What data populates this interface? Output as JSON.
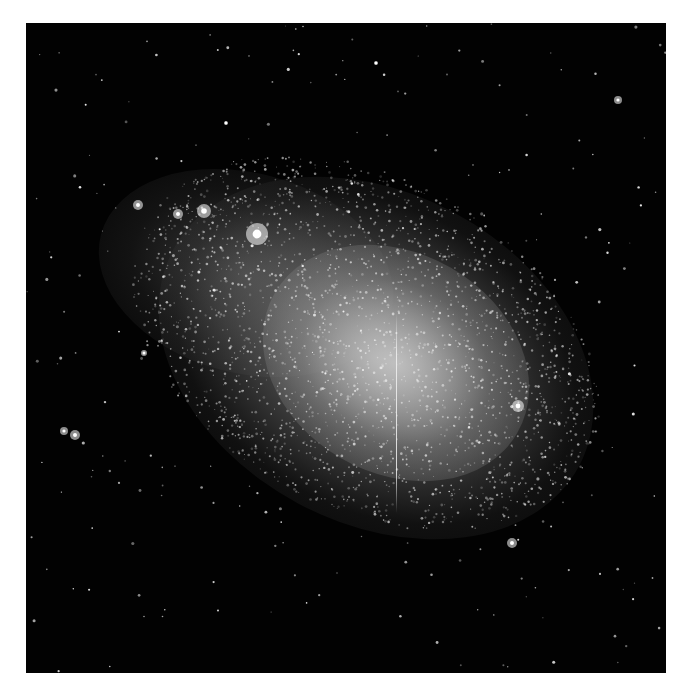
{
  "image": {
    "subject": "irregular dwarf galaxy star field",
    "palette": {
      "sky": "#020202",
      "star": "#ffffff",
      "border": "#ffffff"
    }
  }
}
